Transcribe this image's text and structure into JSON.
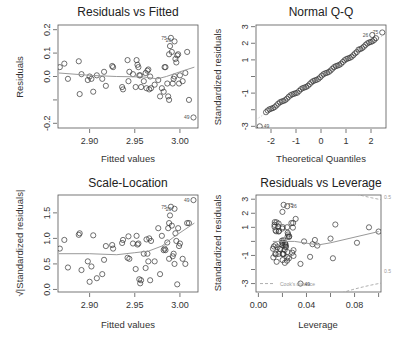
{
  "chart_data": [
    {
      "type": "scatter",
      "title": "Residuals vs Fitted",
      "xlabel": "Fitted values",
      "ylabel": "Residuals",
      "xlim": [
        2.865,
        3.02
      ],
      "ylim": [
        -0.22,
        0.22
      ],
      "xticks": [
        2.9,
        2.95,
        3.0
      ],
      "xtick_labels": [
        "2.90",
        "2.95",
        "3.00"
      ],
      "yticks": [
        -0.2,
        -0.1,
        0.0,
        0.1,
        0.2
      ],
      "ytick_labels": [
        "-0.2",
        "",
        "0.0",
        "0.1",
        "0.2"
      ],
      "labeled_points": [
        {
          "label": "75",
          "x": 2.99,
          "y": 0.165
        },
        {
          "label": "26",
          "x": 2.995,
          "y": 0.155
        },
        {
          "label": "49",
          "x": 3.015,
          "y": -0.175
        }
      ],
      "smooth": [
        [
          2.866,
          0.015
        ],
        [
          2.9,
          0.005
        ],
        [
          2.93,
          0.0
        ],
        [
          2.96,
          -0.002
        ],
        [
          2.975,
          -0.01
        ],
        [
          2.985,
          0.0
        ],
        [
          3.0,
          0.02
        ],
        [
          3.016,
          0.04
        ]
      ],
      "points": [
        [
          2.867,
          0.04
        ],
        [
          2.872,
          0.055
        ],
        [
          2.876,
          -0.01
        ],
        [
          2.888,
          0.065
        ],
        [
          2.889,
          -0.075
        ],
        [
          2.891,
          0.01
        ],
        [
          2.898,
          -0.015
        ],
        [
          2.9,
          0.0
        ],
        [
          2.902,
          -0.01
        ],
        [
          2.904,
          -0.065
        ],
        [
          2.908,
          0.005
        ],
        [
          2.914,
          -0.01
        ],
        [
          2.916,
          0.02
        ],
        [
          2.918,
          -0.04
        ],
        [
          2.925,
          0.045
        ],
        [
          2.926,
          0.04
        ],
        [
          2.936,
          -0.045
        ],
        [
          2.937,
          -0.055
        ],
        [
          2.942,
          0.07
        ],
        [
          2.943,
          -0.02
        ],
        [
          2.944,
          0.02
        ],
        [
          2.948,
          0.01
        ],
        [
          2.951,
          -0.045
        ],
        [
          2.952,
          0.07
        ],
        [
          2.953,
          0.05
        ],
        [
          2.954,
          0.04
        ],
        [
          2.955,
          0.005
        ],
        [
          2.956,
          0.005
        ],
        [
          2.957,
          -0.045
        ],
        [
          2.96,
          -0.02
        ],
        [
          2.962,
          0.015
        ],
        [
          2.963,
          -0.05
        ],
        [
          2.964,
          0.025
        ],
        [
          2.965,
          0.03
        ],
        [
          2.966,
          -0.055
        ],
        [
          2.967,
          0.0
        ],
        [
          2.968,
          -0.05
        ],
        [
          2.972,
          -0.035
        ],
        [
          2.976,
          -0.015
        ],
        [
          2.978,
          -0.085
        ],
        [
          2.98,
          -0.05
        ],
        [
          2.982,
          -0.065
        ],
        [
          2.983,
          0.04
        ],
        [
          2.984,
          0.04
        ],
        [
          2.986,
          -0.03
        ],
        [
          2.987,
          -0.085
        ],
        [
          2.988,
          -0.1
        ],
        [
          2.988,
          0.095
        ],
        [
          2.989,
          0.13
        ],
        [
          2.99,
          0.165
        ],
        [
          2.991,
          0.105
        ],
        [
          2.992,
          -0.03
        ],
        [
          2.993,
          -0.01
        ],
        [
          2.994,
          0.0
        ],
        [
          2.994,
          0.15
        ],
        [
          2.995,
          0.075
        ],
        [
          2.996,
          0.06
        ],
        [
          2.997,
          0.09
        ],
        [
          2.998,
          0.095
        ],
        [
          2.999,
          -0.03
        ],
        [
          3.0,
          0.005
        ],
        [
          3.003,
          -0.02
        ],
        [
          3.006,
          0.015
        ],
        [
          3.008,
          0.105
        ],
        [
          3.01,
          -0.1
        ],
        [
          3.015,
          -0.175
        ]
      ]
    },
    {
      "type": "scatter",
      "title": "Normal Q-Q",
      "xlabel": "Theoretical Quantiles",
      "ylabel": "Standardized residuals",
      "xlim": [
        -2.6,
        2.6
      ],
      "ylim": [
        -3.1,
        3.1
      ],
      "xticks": [
        -2,
        -1,
        0,
        1,
        2
      ],
      "xtick_labels": [
        "-2",
        "-1",
        "0",
        "1",
        "2"
      ],
      "yticks": [
        -3,
        -2,
        -1,
        0,
        1,
        2,
        3
      ],
      "ytick_labels": [
        "-3",
        "",
        "-1",
        "",
        "1",
        "2",
        "3"
      ],
      "labeled_points": [
        {
          "label": "49",
          "x": -2.45,
          "y": -3.0
        },
        {
          "label": "26",
          "x": 2.05,
          "y": 2.5
        },
        {
          "label": "75",
          "x": 2.45,
          "y": 2.65
        }
      ],
      "reference_line": [
        [
          -2.6,
          -2.6
        ],
        [
          2.6,
          2.6
        ]
      ],
      "points_description": "approximately linear from (-2.2,-2.0) to (2.45,2.65) with one outlier at (-2.45,-3.0)"
    },
    {
      "type": "scatter",
      "title": "Scale-Location",
      "xlabel": "Fitted values",
      "ylabel": "√|Standardized residuals|",
      "xlim": [
        2.865,
        3.02
      ],
      "ylim": [
        -0.05,
        1.85
      ],
      "xticks": [
        2.9,
        2.95,
        3.0
      ],
      "xtick_labels": [
        "2.90",
        "2.95",
        "3.00"
      ],
      "yticks": [
        0.0,
        0.5,
        1.0,
        1.5
      ],
      "ytick_labels": [
        "0.0",
        "0.5",
        "1.0",
        "1.5"
      ],
      "labeled_points": [
        {
          "label": "49",
          "x": 3.015,
          "y": 1.75
        },
        {
          "label": "75",
          "x": 2.99,
          "y": 1.62
        },
        {
          "label": "26",
          "x": 2.995,
          "y": 1.58
        }
      ],
      "smooth": [
        [
          2.866,
          0.7
        ],
        [
          2.9,
          0.7
        ],
        [
          2.93,
          0.68
        ],
        [
          2.95,
          0.72
        ],
        [
          2.965,
          0.75
        ],
        [
          2.98,
          0.85
        ],
        [
          2.995,
          1.05
        ],
        [
          3.016,
          1.3
        ]
      ],
      "points": [
        [
          2.867,
          0.8
        ],
        [
          2.872,
          0.97
        ],
        [
          2.876,
          0.43
        ],
        [
          2.888,
          1.07
        ],
        [
          2.889,
          1.1
        ],
        [
          2.891,
          0.38
        ],
        [
          2.898,
          0.55
        ],
        [
          2.9,
          0.15
        ],
        [
          2.902,
          0.45
        ],
        [
          2.904,
          1.06
        ],
        [
          2.908,
          0.22
        ],
        [
          2.914,
          0.3
        ],
        [
          2.916,
          0.58
        ],
        [
          2.918,
          0.85
        ],
        [
          2.925,
          0.87
        ],
        [
          2.926,
          0.8
        ],
        [
          2.936,
          0.91
        ],
        [
          2.937,
          0.97
        ],
        [
          2.942,
          0.62
        ],
        [
          2.943,
          1.04
        ],
        [
          2.944,
          0.6
        ],
        [
          2.948,
          0.9
        ],
        [
          2.951,
          0.4
        ],
        [
          2.952,
          1.05
        ],
        [
          2.953,
          0.88
        ],
        [
          2.954,
          0.9
        ],
        [
          2.955,
          0.2
        ],
        [
          2.956,
          0.12
        ],
        [
          2.957,
          0.18
        ],
        [
          2.96,
          0.7
        ],
        [
          2.962,
          0.42
        ],
        [
          2.963,
          0.98
        ],
        [
          2.964,
          0.7
        ],
        [
          2.965,
          0.55
        ],
        [
          2.966,
          1.0
        ],
        [
          2.967,
          0.18
        ],
        [
          2.968,
          0.95
        ],
        [
          2.972,
          0.55
        ],
        [
          2.976,
          1.2
        ],
        [
          2.978,
          0.3
        ],
        [
          2.98,
          1.05
        ],
        [
          2.982,
          0.77
        ],
        [
          2.983,
          0.8
        ],
        [
          2.984,
          0.77
        ],
        [
          2.986,
          0.92
        ],
        [
          2.987,
          1.2
        ],
        [
          2.988,
          1.3
        ],
        [
          2.988,
          0.6
        ],
        [
          2.989,
          1.45
        ],
        [
          2.99,
          1.62
        ],
        [
          2.991,
          1.25
        ],
        [
          2.992,
          0.65
        ],
        [
          2.993,
          0.7
        ],
        [
          2.994,
          0.5
        ],
        [
          2.994,
          1.58
        ],
        [
          2.995,
          1.1
        ],
        [
          2.996,
          0.95
        ],
        [
          2.997,
          0.1
        ],
        [
          2.998,
          1.2
        ],
        [
          2.999,
          0.85
        ],
        [
          3.0,
          0.9
        ],
        [
          3.003,
          0.6
        ],
        [
          3.006,
          0.5
        ],
        [
          3.008,
          1.3
        ],
        [
          3.01,
          1.3
        ],
        [
          3.015,
          1.75
        ]
      ]
    },
    {
      "type": "scatter",
      "title": "Residuals vs Leverage",
      "xlabel": "Leverage",
      "ylabel": "Standardized residuals",
      "xlim": [
        -0.002,
        0.102
      ],
      "ylim": [
        -3.6,
        3.3
      ],
      "xticks": [
        0.0,
        0.02,
        0.04,
        0.06,
        0.08,
        0.1
      ],
      "xtick_labels": [
        "0.00",
        "",
        "0.04",
        "",
        "0.08",
        ""
      ],
      "yticks": [
        -3,
        -2,
        -1,
        0,
        1,
        2,
        3
      ],
      "ytick_labels": [
        "-3",
        "",
        "-1",
        "",
        "1",
        "2",
        "3"
      ],
      "labeled_points": [
        {
          "label": "75",
          "x": 0.021,
          "y": 2.6
        },
        {
          "label": "26",
          "x": 0.024,
          "y": 2.5
        },
        {
          "label": "49",
          "x": 0.035,
          "y": -3.0
        }
      ],
      "annotations": [
        "Cook's distance",
        "0.5",
        "0.5"
      ],
      "smooth": [
        [
          0.012,
          0.0
        ],
        [
          0.03,
          0.0
        ],
        [
          0.05,
          -0.25
        ],
        [
          0.06,
          -0.1
        ],
        [
          0.1,
          0.7
        ]
      ],
      "points_description": "dense cluster at leverage 0.012-0.03, standardized residuals -1.6 to 2.6; sparse points up to leverage 0.1"
    }
  ]
}
